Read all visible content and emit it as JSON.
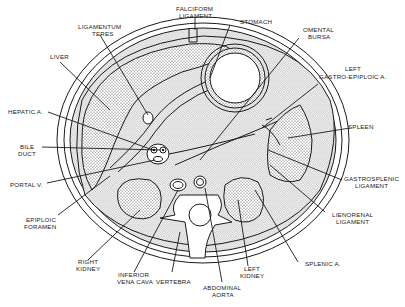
{
  "diagram": {
    "colors": {
      "line": "#1a1a1a",
      "stipple_bg": "#d8d8d8",
      "background": "#ffffff"
    },
    "labels": {
      "falciform": [
        "FALCIFORM",
        "LIGAMENT"
      ],
      "stomach": [
        "STOMACH"
      ],
      "ligamentum_teres": [
        "LIGAMENTUM",
        "TERES"
      ],
      "omental_bursa": [
        "OMENTAL",
        "BURSA"
      ],
      "liver": [
        "LIVER"
      ],
      "left_gastro_epiploic": [
        "LEFT",
        "GASTRO-EPIPLOIC A."
      ],
      "hepatic_a": [
        "HEPATIC A."
      ],
      "spleen": [
        "SPLEEN"
      ],
      "bile_duct": [
        "BILE",
        "DUCT"
      ],
      "portal_v": [
        "PORTAL V."
      ],
      "gastrosplenic": [
        "GASTROSPLENIC",
        "LIGAMENT"
      ],
      "epiploic_foramen": [
        "EPIPLOIC",
        "FORAMEN"
      ],
      "lienorenal": [
        "LIENORENAL",
        "LIGAMENT"
      ],
      "right_kidney": [
        "RIGHT",
        "KIDNEY"
      ],
      "inferior_vena_cava": [
        "INFERIOR",
        "VENA CAVA"
      ],
      "vertebra": [
        "VERTEBRA"
      ],
      "left_kidney": [
        "LEFT",
        "KIDNEY"
      ],
      "splenic_a": [
        "SPLENIC A."
      ],
      "abdominal_aorta": [
        "ABDOMINAL",
        "AORTA"
      ]
    }
  }
}
